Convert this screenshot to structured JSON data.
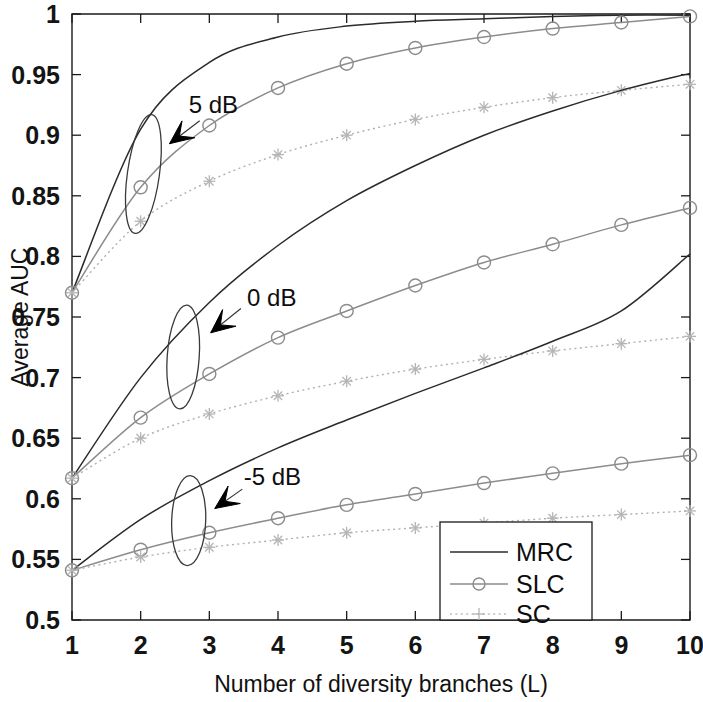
{
  "chart_data": {
    "type": "line",
    "title": "",
    "xlabel": "Number of diversity branches (L)",
    "ylabel": "Average AUC",
    "xlim": [
      1,
      10
    ],
    "ylim": [
      0.5,
      1.0
    ],
    "grid": false,
    "x": [
      1,
      2,
      3,
      4,
      5,
      6,
      7,
      8,
      9,
      10
    ],
    "xticklabels": [
      "1",
      "2",
      "3",
      "4",
      "5",
      "6",
      "7",
      "8",
      "9",
      "10"
    ],
    "yticklabels": [
      "0.5",
      "0.55",
      "0.6",
      "0.65",
      "0.7",
      "0.75",
      "0.8",
      "0.85",
      "0.9",
      "0.95",
      "1"
    ],
    "yticks": [
      0.5,
      0.55,
      0.6,
      0.65,
      0.7,
      0.75,
      0.8,
      0.85,
      0.9,
      0.95,
      1.0
    ],
    "legend_position": "lower right",
    "legend_entries": [
      "MRC",
      "SLC",
      "SC"
    ],
    "groups": [
      {
        "label": "5 dB",
        "series": [
          {
            "name": "MRC",
            "values": [
              0.77,
              0.905,
              0.96,
              0.981,
              0.99,
              0.994,
              0.996,
              0.998,
              0.999,
              0.999
            ]
          },
          {
            "name": "SLC",
            "values": [
              0.77,
              0.857,
              0.908,
              0.939,
              0.959,
              0.972,
              0.981,
              0.988,
              0.993,
              0.998
            ]
          },
          {
            "name": "SC",
            "values": [
              0.77,
              0.829,
              0.862,
              0.884,
              0.9,
              0.913,
              0.923,
              0.931,
              0.937,
              0.942
            ]
          }
        ]
      },
      {
        "label": "0 dB",
        "series": [
          {
            "name": "MRC",
            "values": [
              0.617,
              0.7,
              0.762,
              0.809,
              0.846,
              0.875,
              0.9,
              0.92,
              0.937,
              0.951
            ]
          },
          {
            "name": "SLC",
            "values": [
              0.617,
              0.667,
              0.703,
              0.733,
              0.755,
              0.776,
              0.795,
              0.81,
              0.826,
              0.84
            ]
          },
          {
            "name": "SC",
            "values": [
              0.617,
              0.65,
              0.67,
              0.685,
              0.697,
              0.707,
              0.715,
              0.722,
              0.728,
              0.734
            ]
          }
        ]
      },
      {
        "label": "-5 dB",
        "series": [
          {
            "name": "MRC",
            "values": [
              0.541,
              0.583,
              0.615,
              0.642,
              0.665,
              0.687,
              0.708,
              0.73,
              0.755,
              0.802
            ]
          },
          {
            "name": "SLC",
            "values": [
              0.541,
              0.558,
              0.572,
              0.584,
              0.595,
              0.604,
              0.613,
              0.621,
              0.629,
              0.636
            ]
          },
          {
            "name": "SC",
            "values": [
              0.541,
              0.552,
              0.56,
              0.566,
              0.572,
              0.576,
              0.58,
              0.584,
              0.587,
              0.59
            ]
          }
        ]
      }
    ],
    "annotations": [
      {
        "text": "5 dB",
        "x": 2.7,
        "y": 0.925
      },
      {
        "text": "0 dB",
        "x": 3.55,
        "y": 0.766
      },
      {
        "text": "-5 dB",
        "x": 3.5,
        "y": 0.618
      }
    ]
  },
  "axes": {
    "y_title": "Average AUC",
    "x_title": "Number of diversity branches (L)"
  },
  "legend": {
    "items": [
      {
        "label": "MRC",
        "style": "solid-line"
      },
      {
        "label": "SLC",
        "style": "line-circle-marker"
      },
      {
        "label": "SC",
        "style": "dotted-line-plus-marker"
      }
    ]
  },
  "colors": {
    "mrc": "#2b2b2b",
    "slc": "#8c8c8c",
    "sc": "#b0b0b0",
    "axis": "#1a1a1a",
    "text": "#111111",
    "background": "#ffffff"
  }
}
